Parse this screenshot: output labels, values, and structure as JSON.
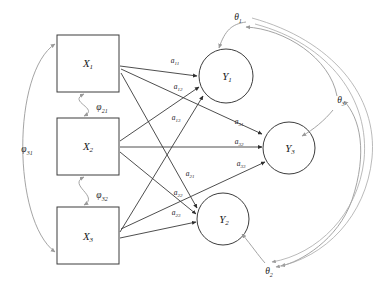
{
  "diagram": {
    "type": "path-diagram",
    "canvas": {
      "width": 377,
      "height": 289,
      "background": "#ffffff"
    },
    "colors": {
      "node_stroke": "#3d3d3d",
      "directed_path": "#3a3a3a",
      "covariance_curve": "#9a9a9a",
      "text": "#1a1a1a"
    },
    "exogenous_nodes": [
      {
        "id": "X1",
        "label": "X",
        "subscript": "1",
        "shape": "rectangle",
        "cx": 88,
        "cy": 63
      },
      {
        "id": "X2",
        "label": "X",
        "subscript": "2",
        "shape": "rectangle",
        "cx": 88,
        "cy": 146
      },
      {
        "id": "X3",
        "label": "X",
        "subscript": "3",
        "shape": "rectangle",
        "cx": 88,
        "cy": 236
      }
    ],
    "endogenous_nodes": [
      {
        "id": "Y1",
        "label": "Y",
        "subscript": "1",
        "shape": "circle",
        "cx": 226,
        "cy": 76,
        "r": 27
      },
      {
        "id": "Y3",
        "label": "Y",
        "subscript": "3",
        "shape": "circle",
        "cx": 289,
        "cy": 148,
        "r": 26
      },
      {
        "id": "Y2",
        "label": "Y",
        "subscript": "2",
        "shape": "circle",
        "cx": 223,
        "cy": 219,
        "r": 26
      }
    ],
    "structural_paths": [
      {
        "id": "a11",
        "label": "a",
        "subscript": "11",
        "from": "X1",
        "to": "Y1",
        "label_x": 175,
        "label_y": 63
      },
      {
        "id": "a12",
        "label": "a",
        "subscript": "12",
        "from": "X2",
        "to": "Y1",
        "label_x": 178,
        "label_y": 88
      },
      {
        "id": "a13",
        "label": "a",
        "subscript": "13",
        "from": "X3",
        "to": "Y1",
        "label_x": 175,
        "label_y": 119
      },
      {
        "id": "a31",
        "label": "a",
        "subscript": "31",
        "from": "X1",
        "to": "Y3",
        "label_x": 238,
        "label_y": 123
      },
      {
        "id": "a32",
        "label": "a",
        "subscript": "32",
        "from": "X2",
        "to": "Y3",
        "label_x": 238,
        "label_y": 145
      },
      {
        "id": "a33",
        "label": "a",
        "subscript": "33",
        "from": "X3",
        "to": "Y3",
        "label_x": 240,
        "label_y": 165
      },
      {
        "id": "a21",
        "label": "a",
        "subscript": "21",
        "from": "X1",
        "to": "Y2",
        "label_x": 189,
        "label_y": 175
      },
      {
        "id": "a22",
        "label": "a",
        "subscript": "22",
        "from": "X2",
        "to": "Y2",
        "label_x": 177,
        "label_y": 194
      },
      {
        "id": "a23",
        "label": "a",
        "subscript": "23",
        "from": "X3",
        "to": "Y2",
        "label_x": 175,
        "label_y": 214
      }
    ],
    "covariances": [
      {
        "id": "phi21",
        "label": "φ",
        "subscript": "21",
        "between": [
          "X1",
          "X2"
        ],
        "label_x": 101,
        "label_y": 108
      },
      {
        "id": "phi32",
        "label": "φ",
        "subscript": "32",
        "between": [
          "X2",
          "X3"
        ],
        "label_x": 101,
        "label_y": 196
      },
      {
        "id": "phi31",
        "label": "φ",
        "subscript": "31",
        "between": [
          "X1",
          "X3"
        ],
        "label_x": 26,
        "label_y": 150
      },
      {
        "id": "theta1",
        "label": "θ",
        "subscript": "1",
        "between": [
          "Y1",
          "Y3"
        ],
        "label_x": 238,
        "label_y": 19
      },
      {
        "id": "theta3",
        "label": "θ",
        "subscript": "3",
        "between": [
          "Y3",
          "Y2"
        ],
        "label_x": 339,
        "label_y": 102
      },
      {
        "id": "theta2",
        "label": "θ",
        "subscript": "2",
        "between": [
          "Y2",
          "Y1"
        ],
        "label_x": 269,
        "label_y": 272
      }
    ]
  }
}
